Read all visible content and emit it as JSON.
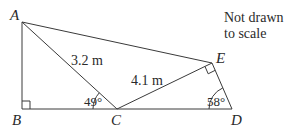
{
  "diagram": {
    "type": "geometry",
    "note": {
      "line1": "Not drawn",
      "line2": "to scale"
    },
    "vertices": {
      "A": {
        "label": "A",
        "x": 22,
        "y": 22
      },
      "B": {
        "label": "B",
        "x": 22,
        "y": 109
      },
      "C": {
        "label": "C",
        "x": 117,
        "y": 109
      },
      "D": {
        "label": "D",
        "x": 232,
        "y": 109
      },
      "E": {
        "label": "E",
        "x": 212,
        "y": 63
      }
    },
    "segments": [
      {
        "from": "A",
        "to": "B"
      },
      {
        "from": "B",
        "to": "D"
      },
      {
        "from": "A",
        "to": "C"
      },
      {
        "from": "C",
        "to": "E"
      },
      {
        "from": "E",
        "to": "D"
      },
      {
        "from": "A",
        "to": "E"
      }
    ],
    "lengths": {
      "AC": "3.2 m",
      "CE": "4.1 m"
    },
    "angles": {
      "ACB": "49°",
      "EDC": "58°"
    },
    "right_angles": [
      "B",
      "E"
    ],
    "colors": {
      "line": "#3a3a3a",
      "text": "#2a2a2a",
      "background": "#ffffff"
    }
  }
}
